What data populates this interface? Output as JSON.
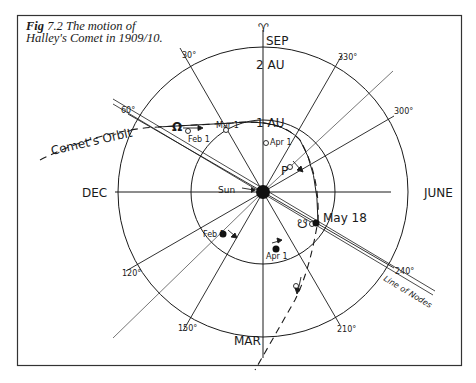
{
  "figure": {
    "label": "Fig",
    "number": "7.2",
    "caption_line1": "The motion of",
    "caption_line2": "Halley's Comet in 1909/10."
  },
  "months": {
    "top": "SEP",
    "bottom": "MAR",
    "left": "DEC",
    "right": "JUNE"
  },
  "symbols": {
    "vernal_equinox": "♈",
    "ascending_node": "Ω",
    "descending_node": "☋",
    "perihelion": "P"
  },
  "distance_labels": {
    "outer": "2 AU",
    "inner": "1 AU"
  },
  "angle_labels": {
    "a30": "30°",
    "a60": "60°",
    "a120": "120°",
    "a150": "150°",
    "a210": "210°",
    "a240": "240°",
    "a300": "300°",
    "a330": "330°"
  },
  "annotations": {
    "sun": "Sun",
    "comet_orbit": "Comet's Orbit",
    "line_of_nodes": "Line of Nodes",
    "comet_feb1": "Feb 1",
    "comet_mar1": "Mar 1",
    "comet_apr1": "Apr 1",
    "earth_feb1": "Feb 1",
    "earth_apr1": "Apr 1",
    "may18": "May 18"
  },
  "colors": {
    "ink": "#1a1a1a",
    "background": "#ffffff"
  }
}
